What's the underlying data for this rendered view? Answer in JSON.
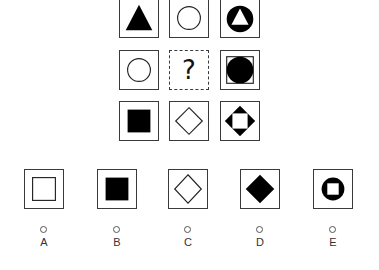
{
  "puzzle": {
    "matrix": [
      [
        {
          "id": "r1c1",
          "shape": "filled-triangle"
        },
        {
          "id": "r1c2",
          "shape": "outline-circle"
        },
        {
          "id": "r1c3",
          "shape": "black-circle-with-white-triangle"
        }
      ],
      [
        {
          "id": "r2c1",
          "shape": "outline-circle"
        },
        {
          "id": "r2c2",
          "shape": "question-mark",
          "text": "?"
        },
        {
          "id": "r2c3",
          "shape": "outline-square-with-black-circle"
        }
      ],
      [
        {
          "id": "r3c1",
          "shape": "filled-square"
        },
        {
          "id": "r3c2",
          "shape": "outline-diamond"
        },
        {
          "id": "r3c3",
          "shape": "black-diamond-with-white-square"
        }
      ]
    ],
    "options": [
      {
        "label": "A",
        "shape": "outline-square"
      },
      {
        "label": "B",
        "shape": "filled-square"
      },
      {
        "label": "C",
        "shape": "outline-diamond"
      },
      {
        "label": "D",
        "shape": "filled-diamond"
      },
      {
        "label": "E",
        "shape": "black-circle-with-white-square"
      }
    ],
    "colors": {
      "stroke": "#3a3a3a",
      "fill": "#000000",
      "background": "#ffffff"
    }
  }
}
